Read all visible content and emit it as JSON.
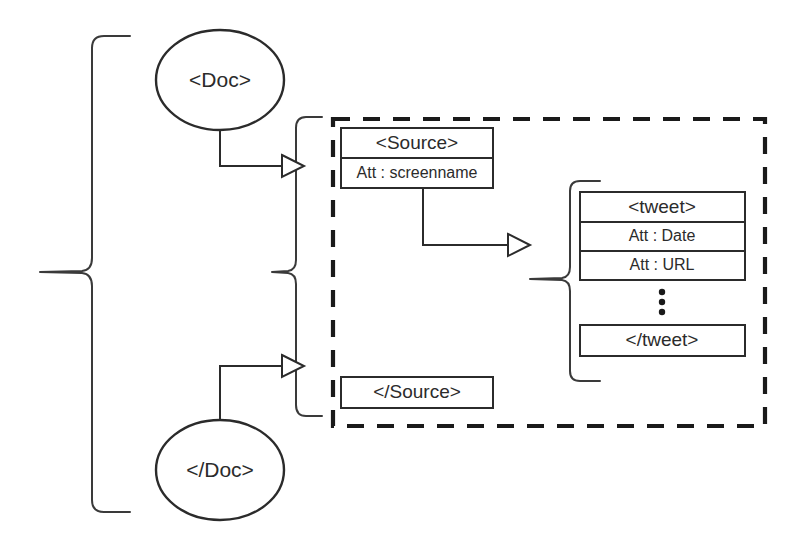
{
  "diagram": {
    "type": "tree-structure-diagram",
    "colors": {
      "background": "#ffffff",
      "stroke": "#2b2b2b",
      "dashed_group_stroke": "#1a1a1a",
      "text": "#2b2b2b"
    },
    "nodes": {
      "doc_open": {
        "label": "<Doc>",
        "shape": "ellipse"
      },
      "doc_close": {
        "label": "</Doc>",
        "shape": "ellipse"
      },
      "source_open": {
        "shape": "rectangle-stack",
        "title": "<Source>",
        "rows": [
          {
            "label": "Att : screenname"
          }
        ]
      },
      "source_close": {
        "label": "</Source>",
        "shape": "rectangle"
      },
      "tweet_open": {
        "shape": "rectangle-stack",
        "title": "<tweet>",
        "rows": [
          {
            "label": "Att : Date"
          },
          {
            "label": "Att : URL"
          }
        ]
      },
      "tweet_ellipsis": {
        "label": "⋮",
        "shape": "vertical-dots",
        "dot_count": 3
      },
      "tweet_close": {
        "label": "</tweet>",
        "shape": "rectangle"
      }
    },
    "groups": {
      "outer_brace": {
        "style": "curly-brace",
        "orientation": "right-pointing"
      },
      "source_brace": {
        "style": "curly-brace",
        "orientation": "right-pointing"
      },
      "tweet_brace": {
        "style": "curly-brace",
        "orientation": "right-pointing"
      },
      "dashed_box": {
        "style": "dashed-rectangle",
        "encloses": "Source element and tweet children"
      }
    },
    "connectors": [
      {
        "from": "doc_open",
        "to": "source_brace",
        "arrow": "hollow-triangle"
      },
      {
        "from": "doc_close",
        "to": "source_brace",
        "arrow": "hollow-triangle"
      },
      {
        "from": "source_open",
        "to": "tweet_brace",
        "arrow": "hollow-triangle"
      }
    ]
  }
}
